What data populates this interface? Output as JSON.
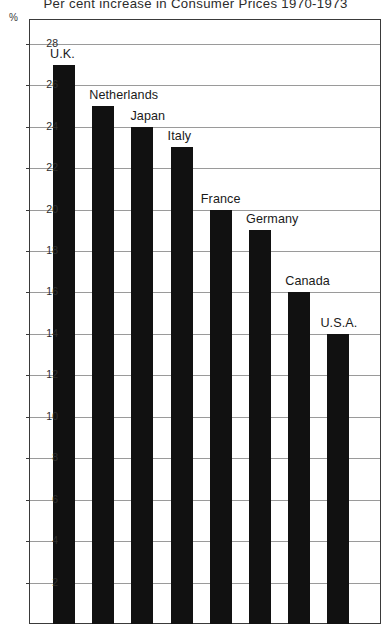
{
  "chart_data": {
    "type": "bar",
    "title": "Per cent increase in Consumer Prices 1970-1973",
    "xlabel": "",
    "ylabel": "%",
    "ylim": [
      0,
      29.5
    ],
    "grid": true,
    "legend": "none",
    "yticks": [
      2,
      4,
      6,
      8,
      10,
      12,
      14,
      16,
      18,
      20,
      22,
      24,
      26,
      28
    ],
    "categories": [
      "U.K.",
      "Netherlands",
      "Japan",
      "Italy",
      "France",
      "Germany",
      "Canada",
      "U.S.A."
    ],
    "values": [
      27,
      25,
      24,
      23,
      20,
      19,
      16,
      14
    ],
    "series": [
      {
        "name": "Per cent increase in Consumer Prices 1970-1973",
        "values": [
          27,
          25,
          24,
          23,
          20,
          19,
          16,
          14
        ]
      }
    ],
    "annotations": [
      {
        "text": "U.K.",
        "value": 27
      },
      {
        "text": "Netherlands",
        "value": 25
      },
      {
        "text": "Japan",
        "value": 24
      },
      {
        "text": "Italy",
        "value": 23
      },
      {
        "text": "France",
        "value": 20
      },
      {
        "text": "Germany",
        "value": 19
      },
      {
        "text": "Canada",
        "value": 16
      },
      {
        "text": "U.S.A.",
        "value": 14
      }
    ],
    "bar_color": "#111111",
    "grid_color": "#9a9a9a",
    "axis_color": "#3a3a3a"
  }
}
